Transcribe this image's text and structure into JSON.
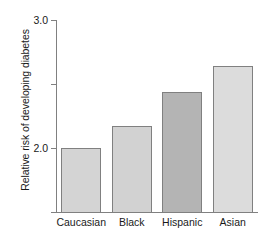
{
  "chart_data": {
    "type": "bar",
    "title": "",
    "subtitle": "",
    "xlabel": "",
    "ylabel": "Relative risk of developing diabetes",
    "categories": [
      "Caucasian",
      "Black",
      "Hispanic",
      "Asian"
    ],
    "values": [
      1.0,
      1.35,
      1.88,
      2.28
    ],
    "bar_colors": [
      "#d4d4d4",
      "#d2d2d2",
      "#b4b4b4",
      "#dcdcdc"
    ],
    "bar_border_color": "#808080",
    "ylim": [
      0,
      3.0
    ],
    "ytick_values": [
      0,
      1.0,
      2.0,
      3.0
    ],
    "ytick_labels": [
      "0",
      "1.0",
      "2.0",
      "3.0"
    ],
    "grid": false,
    "legend": null,
    "axis_color": "#808080",
    "background_color": "#ffffff"
  },
  "axes": {
    "y_label_text": "Relative risk of developing diabetes"
  }
}
